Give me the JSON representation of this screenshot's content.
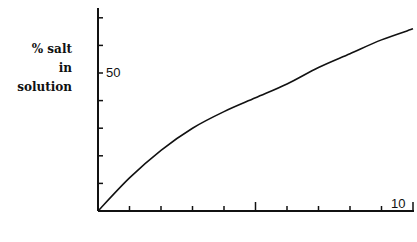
{
  "chart_data": {
    "type": "line",
    "title": "",
    "xlabel": "",
    "ylabel": "% salt in solution",
    "ylabel_lines": [
      "% salt",
      "in solution"
    ],
    "x": [
      0,
      1,
      2,
      3,
      4,
      5,
      6,
      7,
      8,
      9,
      10
    ],
    "series": [
      {
        "name": "% salt in solution",
        "values": [
          0,
          12,
          22,
          30,
          36,
          41,
          46,
          52,
          57,
          62,
          66
        ]
      }
    ],
    "y_tick_labels": [
      {
        "value": 50,
        "label": "50"
      }
    ],
    "x_tick_labels": [
      {
        "value": 10,
        "label": "10"
      }
    ],
    "y_ticks": [
      10,
      20,
      30,
      40,
      50,
      60,
      70
    ],
    "x_ticks": [
      1,
      2,
      3,
      4,
      5,
      6,
      7,
      8,
      9,
      10
    ],
    "xlim": [
      0,
      10
    ],
    "ylim": [
      0,
      75
    ],
    "grid": false,
    "legend": null
  },
  "labels": {
    "y_line1": "% salt",
    "y_line2": "in solution",
    "y50": "50",
    "x10": "10"
  }
}
